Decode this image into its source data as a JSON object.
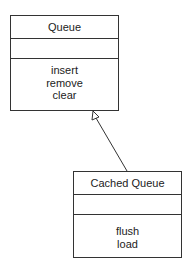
{
  "classes": {
    "queue": {
      "name": "Queue",
      "attributes": [],
      "operations": [
        "insert",
        "remove",
        "clear"
      ]
    },
    "cached_queue": {
      "name": "Cached Queue",
      "attributes": [],
      "operations": [
        "flush",
        "load"
      ]
    }
  },
  "relationships": [
    {
      "type": "generalization",
      "from": "Cached Queue",
      "to": "Queue"
    }
  ]
}
